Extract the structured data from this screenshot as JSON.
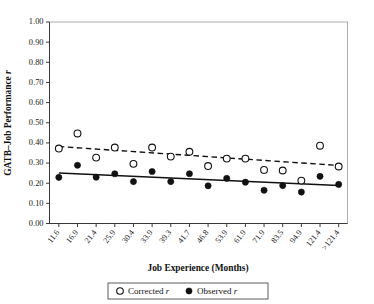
{
  "figure": {
    "caption_present": false
  },
  "chart_data": {
    "type": "scatter",
    "title": "",
    "xlabel": "Job Experience (Months)",
    "ylabel": "GATB–Job Performance r",
    "ylim": [
      0.0,
      1.0
    ],
    "ytick_labels": [
      "0.00",
      "0.10",
      "0.20",
      "0.30",
      "0.40",
      "0.50",
      "0.60",
      "0.70",
      "0.80",
      "0.90",
      "1.00"
    ],
    "ytick_values": [
      0.0,
      0.1,
      0.2,
      0.3,
      0.4,
      0.5,
      0.6,
      0.7,
      0.8,
      0.9,
      1.0
    ],
    "grid": false,
    "legend_position": "below",
    "categories": [
      "11.6",
      "16.9",
      "21.4",
      "25.9",
      "30.4",
      "33.9",
      "39.3",
      "41.7",
      "46.8",
      "53.9",
      "61.9",
      "71.9",
      "83.5",
      "94.9",
      "121.4",
      ">121.4"
    ],
    "series": [
      {
        "name": "Corrected r",
        "marker": "open-circle",
        "trend": "dashed",
        "values": [
          0.372,
          0.447,
          0.327,
          0.377,
          0.296,
          0.377,
          0.332,
          0.356,
          0.285,
          0.322,
          0.322,
          0.266,
          0.263,
          0.213,
          0.386,
          0.283
        ],
        "trend_start": 0.382,
        "trend_end": 0.288
      },
      {
        "name": "Observed r",
        "marker": "filled-circle",
        "trend": "solid",
        "values": [
          0.229,
          0.289,
          0.23,
          0.247,
          0.208,
          0.258,
          0.208,
          0.247,
          0.187,
          0.224,
          0.205,
          0.165,
          0.188,
          0.156,
          0.234,
          0.194
        ],
        "trend_start": 0.251,
        "trend_end": 0.188
      }
    ],
    "legend": [
      {
        "marker": "open-circle",
        "label_text": "Corrected ",
        "label_italic": "r"
      },
      {
        "marker": "filled-circle",
        "label_text": "Observed ",
        "label_italic": "r"
      }
    ],
    "ylabel_text": "GATB–Job Performance ",
    "ylabel_italic": "r"
  }
}
